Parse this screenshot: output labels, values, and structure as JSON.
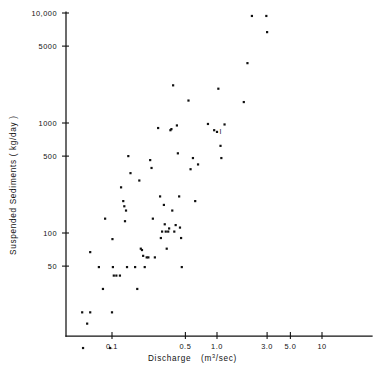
{
  "figure": {
    "background": "#ffffff",
    "ink_color": "#121212"
  },
  "chart_data": {
    "type": "scatter",
    "title": "",
    "subtitle": "",
    "xlabel": "Discharge  (m³/sec)",
    "xlabel_parts": {
      "name": "Discharge",
      "unit_open": "(m",
      "unit_sup": "3",
      "unit_close": "/sec)"
    },
    "ylabel": "Suspended Sediments ( kg/day )",
    "xscale": "log",
    "yscale": "log",
    "xlim": [
      0.038,
      16.0
    ],
    "ylim": [
      8.0,
      11500
    ],
    "grid": false,
    "legend": null,
    "xticks": [
      0.1,
      0.5,
      1.0,
      3.0,
      5.0,
      10
    ],
    "xtick_labels": [
      "0.1",
      "0.5",
      "1.0",
      "3.0",
      "5.0",
      "10"
    ],
    "yticks": [
      50,
      100,
      500,
      1000,
      5000,
      10000
    ],
    "ytick_labels": [
      "50",
      "100",
      "500",
      "1000",
      "5000",
      "10,000"
    ],
    "marker": "square",
    "marker_size_px": 2.2,
    "marker_color": "#101010",
    "annotations": [
      {
        "text": "I",
        "x": 1.0,
        "y": 830,
        "note": "overstruck marker near 1.0 m3/sec"
      }
    ],
    "points": [
      {
        "x": 0.052,
        "y": 19
      },
      {
        "x": 0.062,
        "y": 19
      },
      {
        "x": 0.058,
        "y": 15
      },
      {
        "x": 0.053,
        "y": 9
      },
      {
        "x": 0.062,
        "y": 67
      },
      {
        "x": 0.075,
        "y": 49
      },
      {
        "x": 0.082,
        "y": 31
      },
      {
        "x": 0.086,
        "y": 135
      },
      {
        "x": 0.096,
        "y": 9
      },
      {
        "x": 0.1,
        "y": 19
      },
      {
        "x": 0.101,
        "y": 88
      },
      {
        "x": 0.102,
        "y": 49
      },
      {
        "x": 0.104,
        "y": 41
      },
      {
        "x": 0.11,
        "y": 41
      },
      {
        "x": 0.119,
        "y": 41
      },
      {
        "x": 0.122,
        "y": 260
      },
      {
        "x": 0.128,
        "y": 195
      },
      {
        "x": 0.131,
        "y": 175
      },
      {
        "x": 0.133,
        "y": 128
      },
      {
        "x": 0.136,
        "y": 160
      },
      {
        "x": 0.139,
        "y": 49
      },
      {
        "x": 0.143,
        "y": 500
      },
      {
        "x": 0.15,
        "y": 350
      },
      {
        "x": 0.166,
        "y": 49
      },
      {
        "x": 0.174,
        "y": 31
      },
      {
        "x": 0.182,
        "y": 300
      },
      {
        "x": 0.188,
        "y": 72
      },
      {
        "x": 0.193,
        "y": 70
      },
      {
        "x": 0.198,
        "y": 62
      },
      {
        "x": 0.205,
        "y": 49
      },
      {
        "x": 0.214,
        "y": 60
      },
      {
        "x": 0.222,
        "y": 60
      },
      {
        "x": 0.231,
        "y": 460
      },
      {
        "x": 0.238,
        "y": 390
      },
      {
        "x": 0.245,
        "y": 135
      },
      {
        "x": 0.256,
        "y": 60
      },
      {
        "x": 0.275,
        "y": 900
      },
      {
        "x": 0.287,
        "y": 215
      },
      {
        "x": 0.292,
        "y": 90
      },
      {
        "x": 0.3,
        "y": 103
      },
      {
        "x": 0.312,
        "y": 180
      },
      {
        "x": 0.318,
        "y": 120
      },
      {
        "x": 0.325,
        "y": 103
      },
      {
        "x": 0.332,
        "y": 72
      },
      {
        "x": 0.343,
        "y": 103
      },
      {
        "x": 0.35,
        "y": 110
      },
      {
        "x": 0.36,
        "y": 860
      },
      {
        "x": 0.368,
        "y": 880
      },
      {
        "x": 0.375,
        "y": 160
      },
      {
        "x": 0.382,
        "y": 2200
      },
      {
        "x": 0.392,
        "y": 103
      },
      {
        "x": 0.404,
        "y": 118
      },
      {
        "x": 0.415,
        "y": 950
      },
      {
        "x": 0.424,
        "y": 530
      },
      {
        "x": 0.436,
        "y": 215
      },
      {
        "x": 0.444,
        "y": 112
      },
      {
        "x": 0.455,
        "y": 90
      },
      {
        "x": 0.462,
        "y": 49
      },
      {
        "x": 0.535,
        "y": 1600
      },
      {
        "x": 0.56,
        "y": 380
      },
      {
        "x": 0.59,
        "y": 480
      },
      {
        "x": 0.62,
        "y": 195
      },
      {
        "x": 0.66,
        "y": 420
      },
      {
        "x": 0.82,
        "y": 980
      },
      {
        "x": 0.94,
        "y": 860
      },
      {
        "x": 1.0,
        "y": 830
      },
      {
        "x": 1.03,
        "y": 2050
      },
      {
        "x": 1.08,
        "y": 620
      },
      {
        "x": 1.1,
        "y": 480
      },
      {
        "x": 1.18,
        "y": 970
      },
      {
        "x": 1.8,
        "y": 1550
      },
      {
        "x": 1.95,
        "y": 3500
      },
      {
        "x": 2.15,
        "y": 9400
      },
      {
        "x": 2.95,
        "y": 9400
      },
      {
        "x": 3.0,
        "y": 6700
      }
    ]
  }
}
